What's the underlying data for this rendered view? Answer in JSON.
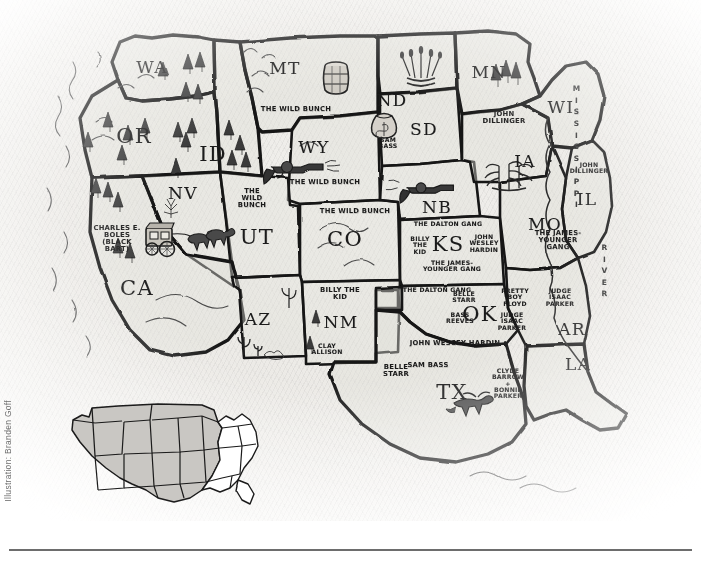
{
  "credit": "Illustration: Branden Goff",
  "map": {
    "title": "Outlaws of the American West",
    "style": "hand-drawn pencil illustration on textured paper",
    "colors": {
      "ink": "#141414",
      "paper": "#eceae6",
      "state_fill": "#e1dfda",
      "inset_shade": "#c9c7c3",
      "credit_text": "#6e6e6e",
      "rule": "#6d6d6d"
    },
    "river_labels": [
      {
        "name": "mississippi-river-label",
        "text": "MISSISSIPPI",
        "x": 576,
        "y": 148
      },
      {
        "name": "river-word-label",
        "text": "RIVER",
        "x": 604,
        "y": 272
      }
    ],
    "states": [
      {
        "abbr": "WA",
        "name": "washington",
        "x": 152,
        "y": 68,
        "size": "normal",
        "outlaws": []
      },
      {
        "abbr": "OR",
        "name": "oregon",
        "x": 134,
        "y": 137,
        "size": "big",
        "outlaws": []
      },
      {
        "abbr": "ID",
        "name": "idaho",
        "x": 213,
        "y": 155,
        "size": "big",
        "outlaws": []
      },
      {
        "abbr": "MT",
        "name": "montana",
        "x": 285,
        "y": 69,
        "size": "normal",
        "outlaws": []
      },
      {
        "abbr": "WY",
        "name": "wyoming",
        "x": 314,
        "y": 148,
        "size": "normal",
        "outlaws": []
      },
      {
        "abbr": "NV",
        "name": "nevada",
        "x": 183,
        "y": 194,
        "size": "normal",
        "outlaws": []
      },
      {
        "abbr": "UT",
        "name": "utah",
        "x": 257,
        "y": 238,
        "size": "big",
        "outlaws": []
      },
      {
        "abbr": "CO",
        "name": "colorado",
        "x": 345,
        "y": 240,
        "size": "big",
        "outlaws": []
      },
      {
        "abbr": "AZ",
        "name": "arizona",
        "x": 258,
        "y": 320,
        "size": "normal",
        "outlaws": []
      },
      {
        "abbr": "NM",
        "name": "new-mexico",
        "x": 341,
        "y": 323,
        "size": "normal",
        "outlaws": []
      },
      {
        "abbr": "ND",
        "name": "north-dakota",
        "x": 392,
        "y": 101,
        "size": "normal",
        "outlaws": []
      },
      {
        "abbr": "SD",
        "name": "south-dakota",
        "x": 424,
        "y": 130,
        "size": "normal",
        "outlaws": []
      },
      {
        "abbr": "NB",
        "name": "nebraska",
        "x": 437,
        "y": 208,
        "size": "normal",
        "outlaws": []
      },
      {
        "abbr": "KS",
        "name": "kansas",
        "x": 448,
        "y": 245,
        "size": "big",
        "outlaws": []
      },
      {
        "abbr": "OK",
        "name": "oklahoma",
        "x": 480,
        "y": 315,
        "size": "big",
        "outlaws": []
      },
      {
        "abbr": "TX",
        "name": "texas",
        "x": 452,
        "y": 393,
        "size": "big",
        "outlaws": []
      },
      {
        "abbr": "MN",
        "name": "minnesota",
        "x": 489,
        "y": 73,
        "size": "normal",
        "outlaws": []
      },
      {
        "abbr": "IA",
        "name": "iowa",
        "x": 525,
        "y": 162,
        "size": "normal",
        "outlaws": []
      },
      {
        "abbr": "WI",
        "name": "wisconsin",
        "x": 561,
        "y": 108,
        "size": "normal",
        "outlaws": []
      },
      {
        "abbr": "IL",
        "name": "illinois",
        "x": 587,
        "y": 200,
        "size": "normal",
        "outlaws": []
      },
      {
        "abbr": "MO",
        "name": "missouri",
        "x": 545,
        "y": 225,
        "size": "normal",
        "outlaws": []
      },
      {
        "abbr": "AR",
        "name": "arkansas",
        "x": 572,
        "y": 330,
        "size": "normal",
        "outlaws": []
      },
      {
        "abbr": "LA",
        "name": "louisiana",
        "x": 578,
        "y": 365,
        "size": "normal",
        "outlaws": []
      },
      {
        "abbr": "CA",
        "name": "california",
        "x": 137,
        "y": 289,
        "size": "big",
        "outlaws": []
      }
    ],
    "outlaw_labels": [
      {
        "id": "mt-wild-bunch",
        "text": "THE WILD BUNCH",
        "state": "MT",
        "x": 296,
        "y": 110,
        "size": "tiny"
      },
      {
        "id": "wy-wild-bunch",
        "text": "THE WILD BUNCH",
        "state": "WY",
        "x": 325,
        "y": 183,
        "size": "tiny"
      },
      {
        "id": "ut-wild-bunch",
        "text": "THE\nWILD\nBUNCH",
        "state": "UT",
        "x": 252,
        "y": 199,
        "size": "tiny"
      },
      {
        "id": "co-wild-bunch",
        "text": "THE WILD BUNCH",
        "state": "CO",
        "x": 355,
        "y": 212,
        "size": "tiny"
      },
      {
        "id": "sd-sam-bass",
        "text": "SAM\nBASS",
        "state": "SD",
        "x": 388,
        "y": 143,
        "size": "wee"
      },
      {
        "id": "mn-john-dillinger",
        "text": "JOHN\nDILLINGER",
        "state": "MN",
        "x": 504,
        "y": 118,
        "size": "tiny"
      },
      {
        "id": "il-john-dillinger",
        "text": "JOHN\nDILLINGER",
        "state": "IL",
        "x": 589,
        "y": 168,
        "size": "wee"
      },
      {
        "id": "mo-james-younger",
        "text": "THE JAMES-\nYOUNGER\nGANG",
        "state": "MO",
        "x": 558,
        "y": 241,
        "size": "tiny"
      },
      {
        "id": "ks-dalton-gang",
        "text": "THE DALTON GANG",
        "state": "KS",
        "x": 448,
        "y": 224,
        "size": "wee"
      },
      {
        "id": "ks-billy-the-kid",
        "text": "BILLY\nTHE\nKID",
        "state": "KS",
        "x": 420,
        "y": 245,
        "size": "wee"
      },
      {
        "id": "ks-john-wesley-hardin",
        "text": "JOHN\nWESLEY\nHARDIN",
        "state": "KS",
        "x": 484,
        "y": 243,
        "size": "wee"
      },
      {
        "id": "ks-james-younger",
        "text": "THE JAMES-\nYOUNGER GANG",
        "state": "KS",
        "x": 452,
        "y": 266,
        "size": "wee"
      },
      {
        "id": "ok-dalton-gang",
        "text": "THE DALTON GANG",
        "state": "OK",
        "x": 437,
        "y": 290,
        "size": "wee"
      },
      {
        "id": "ok-belle-starr",
        "text": "BELLE\nSTARR",
        "state": "OK",
        "x": 464,
        "y": 297,
        "size": "wee"
      },
      {
        "id": "ok-bass-reeves",
        "text": "BASS\nREEVES",
        "state": "OK",
        "x": 460,
        "y": 318,
        "size": "wee"
      },
      {
        "id": "ok-pretty-boy-floyd",
        "text": "PRETTY\nBOY\nFLOYD",
        "state": "OK",
        "x": 515,
        "y": 297,
        "size": "wee"
      },
      {
        "id": "ok-judge-parker",
        "text": "JUDGE\nISAAC\nPARKER",
        "state": "OK",
        "x": 512,
        "y": 321,
        "size": "wee"
      },
      {
        "id": "ar-judge-parker",
        "text": "JUDGE\nISAAC\nPARKER",
        "state": "AR",
        "x": 560,
        "y": 297,
        "size": "wee"
      },
      {
        "id": "nm-billy-the-kid",
        "text": "BILLY THE\nKID",
        "state": "NM",
        "x": 340,
        "y": 294,
        "size": "tiny"
      },
      {
        "id": "nm-clay-allison",
        "text": "CLAY\nALLISON",
        "state": "NM",
        "x": 327,
        "y": 349,
        "size": "wee"
      },
      {
        "id": "tx-john-wesley-hardin",
        "text": "JOHN WESCEY HARDIN",
        "state": "TX",
        "x": 455,
        "y": 344,
        "size": "tiny"
      },
      {
        "id": "tx-sam-bass",
        "text": "SAM BASS",
        "state": "TX",
        "x": 428,
        "y": 366,
        "size": "tiny"
      },
      {
        "id": "tx-belle-starr",
        "text": "BELLE\nSTARR",
        "state": "TX",
        "x": 396,
        "y": 371,
        "size": "tiny"
      },
      {
        "id": "tx-bonnie-clyde",
        "text": "CLYDE\nBARROW\n+\nBONNIE\nPARKER",
        "state": "TX",
        "x": 508,
        "y": 384,
        "size": "wee"
      },
      {
        "id": "ca-black-bart",
        "text": "CHARLES E.\nBOLES\n(BLACK\nBART)",
        "state": "CA",
        "x": 117,
        "y": 239,
        "size": "tiny"
      }
    ],
    "doodles": [
      {
        "id": "mt-barrel",
        "kind": "barrel-icon",
        "x": 336,
        "y": 78
      },
      {
        "id": "sd-wheat",
        "kind": "wheat-sheaf-icon",
        "x": 421,
        "y": 62
      },
      {
        "id": "sd-sack",
        "kind": "money-sack-icon",
        "x": 384,
        "y": 123
      },
      {
        "id": "wy-revolver",
        "kind": "revolver-icon",
        "x": 297,
        "y": 165
      },
      {
        "id": "nb-revolver",
        "kind": "revolver-icon",
        "x": 420,
        "y": 183
      },
      {
        "id": "ia-corn",
        "kind": "corn-stalk-icon",
        "x": 509,
        "y": 170
      },
      {
        "id": "nv-stagecoach",
        "kind": "stagecoach-icon",
        "x": 168,
        "y": 240
      },
      {
        "id": "nv-cactus",
        "kind": "cactus-icon",
        "x": 171,
        "y": 210
      },
      {
        "id": "az-cactus-a",
        "kind": "cactus-icon",
        "x": 289,
        "y": 296
      },
      {
        "id": "az-cactus-b",
        "kind": "cactus-icon",
        "x": 248,
        "y": 343
      },
      {
        "id": "tx-longhorn",
        "kind": "longhorn-icon",
        "x": 470,
        "y": 403
      }
    ]
  },
  "inset": {
    "name": "united-states-locator-inset",
    "description": "Small grey-shaded United States locator map showing the western region covered by the main illustration"
  }
}
